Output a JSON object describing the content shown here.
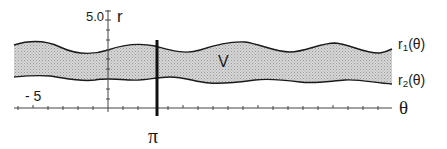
{
  "figure": {
    "region_label": "V",
    "axis_labels": {
      "vertical": "r",
      "horizontal": "θ"
    },
    "tick_labels": {
      "y_top": "5.0",
      "x_left": "- 5",
      "x_marker": "π"
    },
    "curve_labels": {
      "upper": "r",
      "upper_sub": "1",
      "upper_arg": "(θ)",
      "lower": "r",
      "lower_sub": "2",
      "lower_arg": "(θ)"
    },
    "colors": {
      "ink": "#1a1a1a",
      "region_fill": "#c8c8c8",
      "axis": "#444444"
    }
  }
}
